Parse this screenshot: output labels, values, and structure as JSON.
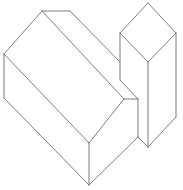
{
  "figure": {
    "width": 183,
    "height": 190,
    "background": "#ffffff",
    "stroke_color": "#6e6e6e",
    "stroke_width": 0.9
  },
  "shapes": [
    {
      "name": "house-prism",
      "edges": [
        [
          42,
          11,
          70,
          11
        ],
        [
          70,
          11,
          120,
          62
        ],
        [
          42,
          11,
          4,
          54
        ],
        [
          4,
          54,
          4,
          98
        ],
        [
          4,
          54,
          89,
          143
        ],
        [
          42,
          11,
          124,
          99
        ],
        [
          124,
          99,
          89,
          143
        ],
        [
          89,
          143,
          89,
          185
        ],
        [
          4,
          98,
          89,
          185
        ],
        [
          89,
          185,
          138,
          137
        ],
        [
          124,
          99,
          138,
          99
        ],
        [
          138,
          99,
          138,
          137
        ]
      ]
    },
    {
      "name": "tall-box",
      "edges": [
        [
          148,
          3,
          120,
          33
        ],
        [
          148,
          3,
          176,
          33
        ],
        [
          120,
          33,
          148,
          62
        ],
        [
          176,
          33,
          148,
          62
        ],
        [
          120,
          33,
          120,
          80
        ],
        [
          120,
          80,
          138,
          99
        ],
        [
          148,
          62,
          148,
          147
        ],
        [
          176,
          33,
          176,
          117
        ],
        [
          176,
          117,
          148,
          147
        ],
        [
          138,
          137,
          148,
          147
        ]
      ]
    }
  ]
}
